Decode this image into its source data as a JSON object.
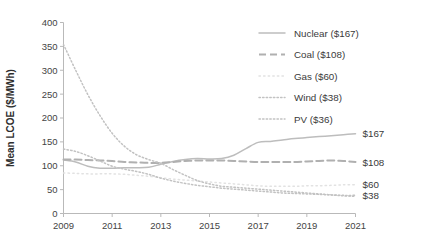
{
  "chart_data": {
    "type": "line",
    "title": "",
    "xlabel": "",
    "ylabel": "Mean LCOE ($/MWh)",
    "xlim": [
      2009,
      2021
    ],
    "ylim": [
      0,
      400
    ],
    "ytick_labels": [
      "0",
      "50",
      "100",
      "150",
      "200",
      "250",
      "300",
      "350",
      "400"
    ],
    "yticks": [
      0,
      50,
      100,
      150,
      200,
      250,
      300,
      350,
      400
    ],
    "xtick_labels": [
      "2009",
      "2011",
      "2013",
      "2015",
      "2017",
      "2019",
      "2021"
    ],
    "xticks": [
      2009,
      2011,
      2013,
      2015,
      2017,
      2019,
      2021
    ],
    "grid": false,
    "legend_position": "upper right",
    "x": [
      2009,
      2009.5,
      2010,
      2010.5,
      2011,
      2011.5,
      2012,
      2012.5,
      2013,
      2013.5,
      2014,
      2014.5,
      2015,
      2015.5,
      2016,
      2016.5,
      2017,
      2017.5,
      2018,
      2018.5,
      2019,
      2019.5,
      2020,
      2020.5,
      2021
    ],
    "series": [
      {
        "name": "Nuclear ($167)",
        "label": "Nuclear",
        "end_value": 167,
        "end_label": "$167",
        "style": "solid",
        "color": "#bdbdbd",
        "values": [
          112,
          108,
          99,
          95,
          95,
          96,
          96,
          97,
          103,
          109,
          113,
          115,
          114,
          115,
          122,
          136,
          149,
          151,
          154,
          157,
          159,
          161,
          163,
          165,
          167
        ]
      },
      {
        "name": "Coal ($108)",
        "label": "Coal",
        "end_value": 108,
        "end_label": "$108",
        "style": "dashed",
        "color": "#b0b0b0",
        "values": [
          113,
          113,
          112,
          111,
          110,
          108,
          107,
          106,
          106,
          108,
          110,
          111,
          111,
          111,
          110,
          109,
          108,
          108,
          108,
          108,
          109,
          110,
          111,
          110,
          108
        ]
      },
      {
        "name": "Gas ($60)",
        "label": "Gas",
        "end_value": 60,
        "end_label": "$60",
        "style": "dotted-sparse",
        "color": "#e2e2e2",
        "values": [
          85,
          84,
          83,
          83,
          83,
          82,
          80,
          78,
          75,
          72,
          70,
          68,
          66,
          64,
          62,
          60,
          58,
          57,
          57,
          57,
          58,
          58,
          59,
          60,
          60
        ]
      },
      {
        "name": "Wind ($38)",
        "label": "Wind",
        "end_value": 38,
        "end_label": "$38",
        "style": "dotted",
        "color": "#c2c2c2",
        "values": [
          135,
          130,
          121,
          110,
          99,
          93,
          88,
          82,
          74,
          68,
          63,
          59,
          56,
          53,
          51,
          49,
          47,
          45,
          43,
          42,
          41,
          40,
          39,
          38,
          38
        ]
      },
      {
        "name": "PV ($36)",
        "label": "PV",
        "end_value": 36,
        "end_label": "$36",
        "style": "dotted",
        "color": "#c2c2c2",
        "values": [
          354,
          300,
          249,
          205,
          168,
          141,
          123,
          113,
          105,
          92,
          80,
          69,
          62,
          57,
          55,
          53,
          51,
          49,
          47,
          45,
          43,
          41,
          39,
          37,
          36
        ]
      }
    ],
    "right_labels": [
      {
        "text": "$167",
        "value": 167
      },
      {
        "text": "$108",
        "value": 108
      },
      {
        "text": "$60",
        "value": 60
      },
      {
        "text": "$38",
        "value": 38
      }
    ]
  },
  "colors": {
    "axis": "#b9b9b9",
    "text": "#3a3a3a",
    "background": "#ffffff"
  }
}
